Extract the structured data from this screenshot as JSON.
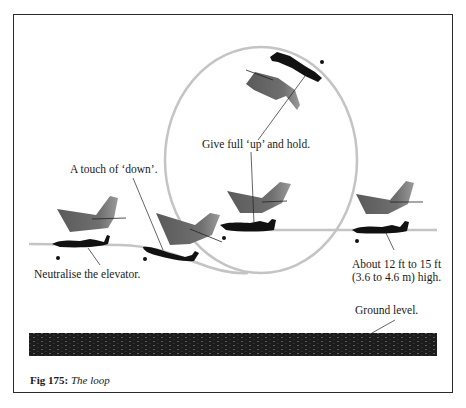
{
  "figure": {
    "caption_number": "Fig 175:",
    "caption_title": "The loop",
    "colors": {
      "frame": "#2a2a2a",
      "flight_path": "#c4c4c4",
      "aircraft": "#111111",
      "shadow_plane": "#6e6e6e",
      "ground": "#1c1c1c",
      "text": "#1a1a1a"
    }
  },
  "labels": {
    "give_full_up": "Give full ‘up’ and hold.",
    "touch_of_down": "A touch of ‘down’.",
    "neutralise": "Neutralise the elevator.",
    "height_line1": "About 12 ft to 15 ft",
    "height_line2": "(3.6 to 4.6 m) high.",
    "ground_level": "Ground level."
  }
}
